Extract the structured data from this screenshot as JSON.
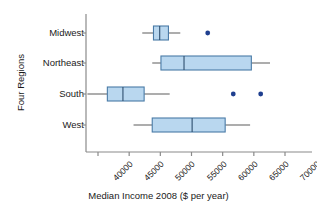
{
  "chart_data": {
    "type": "box",
    "title": "",
    "xlabel": "Median Income 2008 ($ per year)",
    "ylabel": "Four Regions",
    "orientation": "horizontal",
    "xlim": [
      37000,
      72000
    ],
    "xticks": [
      40000,
      45000,
      50000,
      55000,
      60000,
      65000,
      70000
    ],
    "xticklabels": [
      "40000",
      "45000",
      "50000",
      "55000",
      "60000",
      "65000",
      "70000"
    ],
    "grid": false,
    "legend": null,
    "categories": [
      "Midwest",
      "Northeast",
      "South",
      "West"
    ],
    "boxes": [
      {
        "name": "Midwest",
        "whisker_low": 47100,
        "q1": 48900,
        "median": 49900,
        "q3": 51300,
        "whisker_high": 53200,
        "outliers": [
          57600
        ]
      },
      {
        "name": "Northeast",
        "whisker_low": 48700,
        "q1": 50100,
        "median": 53800,
        "q3": 64600,
        "whisker_high": 67600,
        "outliers": []
      },
      {
        "name": "South",
        "whisker_low": 38300,
        "q1": 41500,
        "median": 44000,
        "q3": 47400,
        "whisker_high": 51500,
        "outliers": [
          61700,
          66100
        ]
      },
      {
        "name": "West",
        "whisker_low": 45700,
        "q1": 48700,
        "median": 55100,
        "q3": 60400,
        "whisker_high": 64400,
        "outliers": []
      }
    ],
    "colors": {
      "box_fill": "#b9d7ef",
      "box_stroke": "#4a7ba7",
      "whisker": "#6b6b6b",
      "outlier": "#1f3f8f",
      "axis": "#8a8a8a",
      "text": "#1a1a1a"
    }
  },
  "axis": {
    "y_title": "Four Regions",
    "x_title": "Median Income 2008 ($ per year)"
  }
}
